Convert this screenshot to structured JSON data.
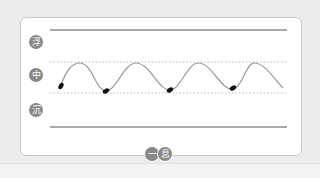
{
  "diagram": {
    "labels": {
      "float": "浮",
      "middle": "中",
      "sink": "沉"
    },
    "bottom_badges": [
      "一",
      "息"
    ],
    "colors": {
      "label_bg": "#888888",
      "wave": "#999999",
      "marker": "#111111",
      "solid_line": "#555555",
      "dotted_line": "#bbbbbb"
    },
    "wave_count": 4
  }
}
